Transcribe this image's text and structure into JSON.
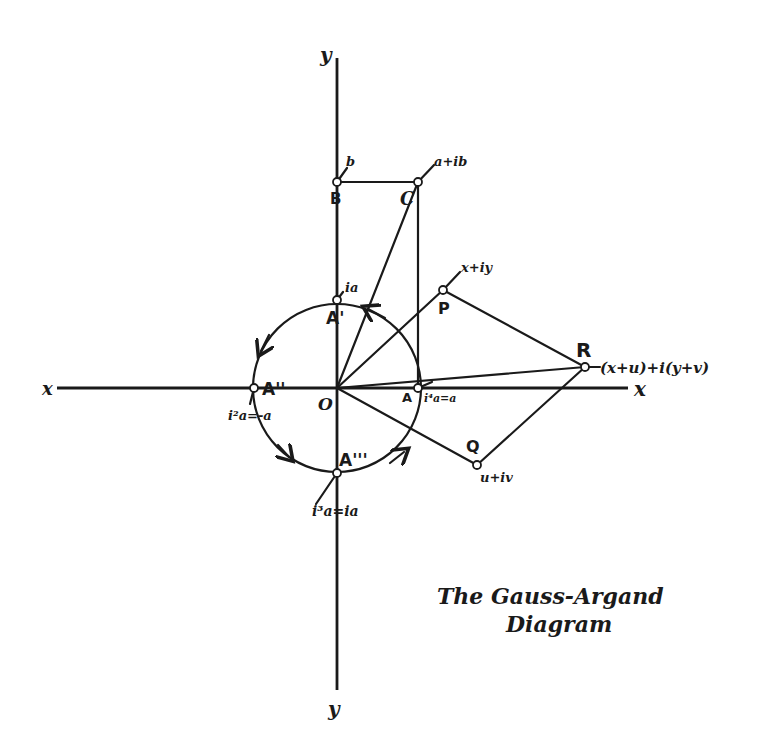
{
  "title": {
    "line1": "The Gauss-Argand",
    "line2": "Diagram"
  },
  "axes": {
    "x_left_label": "x",
    "x_right_label": "x",
    "y_top_label": "y",
    "y_bottom_label": "y"
  },
  "origin": {
    "label": "O"
  },
  "points": {
    "A": {
      "label": "A",
      "value": "i⁴a=a"
    },
    "A1": {
      "label": "A'",
      "value": "ia"
    },
    "A2": {
      "label": "A''",
      "value": "i²a=-a"
    },
    "A3": {
      "label": "A'''",
      "value": "i³a=ia"
    },
    "B": {
      "label": "B",
      "value": "b"
    },
    "C": {
      "label": "C",
      "value": "a+ib"
    },
    "P": {
      "label": "P",
      "value": "x+iy"
    },
    "Q": {
      "label": "Q",
      "value": "u+iv"
    },
    "R": {
      "label": "R",
      "value": "(x+u)+i(y+v)"
    }
  },
  "colors": {
    "ink": "#1a1a1a",
    "paper": "#ffffff"
  }
}
